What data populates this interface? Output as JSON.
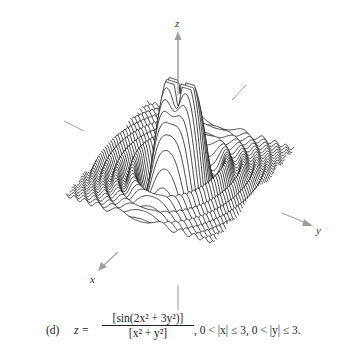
{
  "chart_data": {
    "type": "surface-3d-wireframe",
    "function": "z = sin(2x^2 + 3y^2) / (x^2 + y^2)",
    "domain": {
      "x": [
        -3,
        3
      ],
      "y": [
        -3,
        3
      ],
      "excluded": "x = 0 or y = 0 near origin"
    },
    "axes": {
      "x_label": "x",
      "y_label": "y",
      "z_label": "z"
    },
    "grid": false,
    "legend": null,
    "style": {
      "line_color": "#111111",
      "axis_color": "#999999",
      "background": "#ffffff"
    }
  },
  "labels": {
    "z_axis": "z",
    "y_axis": "y",
    "x_axis": "x"
  },
  "caption": {
    "tag": "(d)",
    "lhs": "z =",
    "numerator": "[sin(2x² + 3y²)]",
    "denominator": "[x² + y²]",
    "domain_text": ", 0 < |x| ≤ 3, 0 < |y| ≤ 3."
  }
}
